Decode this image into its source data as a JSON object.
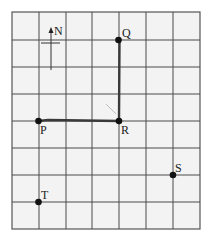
{
  "diagram": {
    "type": "grid-map",
    "grid": {
      "columns": 7,
      "rows": 8,
      "x_lines": [
        12,
        39,
        66,
        92,
        119,
        146,
        173,
        200
      ],
      "y_lines": [
        12,
        40,
        67,
        94,
        121,
        148,
        175,
        202,
        229
      ]
    },
    "compass": {
      "label": "N",
      "direction": "north-up"
    },
    "points": [
      {
        "id": "Q",
        "label": "Q",
        "col": 4,
        "row": 1
      },
      {
        "id": "P",
        "label": "P",
        "col": 1,
        "row": 4
      },
      {
        "id": "R",
        "label": "R",
        "col": 4,
        "row": 4
      },
      {
        "id": "S",
        "label": "S",
        "col": 6,
        "row": 6
      },
      {
        "id": "T",
        "label": "T",
        "col": 1,
        "row": 7
      }
    ],
    "route": [
      "P",
      "R",
      "Q"
    ],
    "colors": {
      "background": "#f3f3f3",
      "grid": "#4a4a4a",
      "route": "#3a3a3a",
      "point": "#111111"
    }
  }
}
